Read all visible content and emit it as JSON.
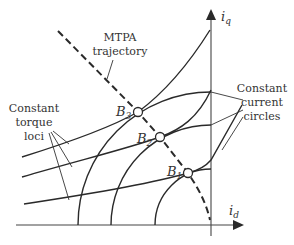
{
  "diagram": {
    "axes": {
      "x_label": "i",
      "x_sub": "d",
      "y_label": "i",
      "y_sub": "q"
    },
    "labels": {
      "mtpa_line1": "MTPA",
      "mtpa_line2": "trajectory",
      "torque_line1": "Constant",
      "torque_line2": "torque",
      "torque_line3": "loci",
      "current_line1": "Constant",
      "current_line2": "current",
      "current_line3": "circles"
    },
    "points": [
      {
        "name": "B",
        "sub": "3"
      },
      {
        "name": "B",
        "sub": "2"
      },
      {
        "name": "B",
        "sub": "1"
      }
    ],
    "colors": {
      "line": "#2a2a2a",
      "text": "#333333",
      "background": "#ffffff"
    }
  }
}
